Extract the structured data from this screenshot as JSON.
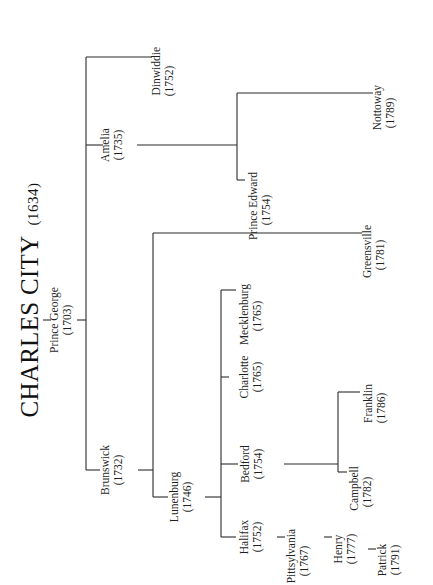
{
  "title": {
    "name": "CHARLES CITY",
    "year": "(1634)"
  },
  "nodes": {
    "prince_george": {
      "name": "Prince George",
      "year": "(1703)"
    },
    "dinwiddie": {
      "name": "Dinwiddie",
      "year": "(1752)"
    },
    "amelia": {
      "name": "Amelia",
      "year": "(1735)"
    },
    "nottoway": {
      "name": "Nottoway",
      "year": "(1789)"
    },
    "prince_edward": {
      "name": "Prince Edward",
      "year": "(1754)"
    },
    "brunswick": {
      "name": "Brunswick",
      "year": "(1732)"
    },
    "greensville": {
      "name": "Greensville",
      "year": "(1781)"
    },
    "lunenburg": {
      "name": "Lunenburg",
      "year": "(1746)"
    },
    "mecklenburg": {
      "name": "Mecklenburg",
      "year": "(1765)"
    },
    "charlotte": {
      "name": "Charlotte",
      "year": "(1765)"
    },
    "bedford": {
      "name": "Bedford",
      "year": "(1754)"
    },
    "franklin": {
      "name": "Franklin",
      "year": "(1786)"
    },
    "campbell": {
      "name": "Campbell",
      "year": "(1782)"
    },
    "halifax": {
      "name": "Halifax",
      "year": "(1752)"
    },
    "pittsylvania": {
      "name": "Pittsylvania",
      "year": "(1767)"
    },
    "henry": {
      "name": "Henry",
      "year": "(1777)"
    },
    "patrick": {
      "name": "Patrick",
      "year": "(1791)"
    }
  },
  "hierarchy": [
    {
      "parent": "Charles City",
      "children": [
        "Prince George"
      ]
    },
    {
      "parent": "Prince George",
      "children": [
        "Dinwiddie",
        "Amelia",
        "Brunswick"
      ]
    },
    {
      "parent": "Amelia",
      "children": [
        "Nottoway",
        "Prince Edward"
      ]
    },
    {
      "parent": "Brunswick",
      "children": [
        "Greensville",
        "Lunenburg"
      ]
    },
    {
      "parent": "Lunenburg",
      "children": [
        "Mecklenburg",
        "Charlotte",
        "Bedford",
        "Halifax"
      ]
    },
    {
      "parent": "Bedford",
      "children": [
        "Franklin",
        "Campbell"
      ]
    },
    {
      "parent": "Halifax",
      "children": [
        "Pittsylvania"
      ]
    },
    {
      "parent": "Pittsylvania",
      "children": [
        "Henry"
      ]
    },
    {
      "parent": "Henry",
      "children": [
        "Patrick"
      ]
    }
  ],
  "colors": {
    "line": "#2a2a2a",
    "text": "#1f1f1f",
    "background": "#ffffff"
  }
}
